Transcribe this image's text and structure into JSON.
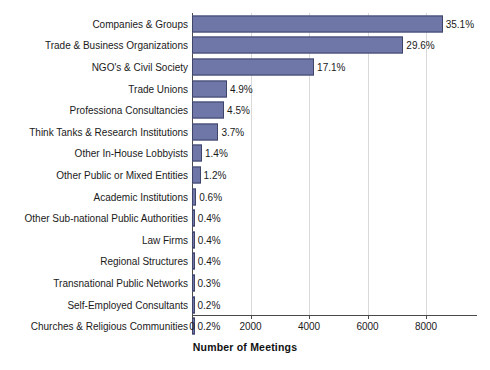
{
  "chart_data": {
    "type": "bar",
    "orientation": "horizontal",
    "title": "",
    "xlabel": "Number of Meetings",
    "ylabel": "",
    "xlim": [
      0,
      9740
    ],
    "xticks": [
      0,
      2000,
      4000,
      6000,
      8000
    ],
    "xtick_labels": [
      "0",
      "2000",
      "4000",
      "6000",
      "8000"
    ],
    "grid": "vertical",
    "legend": "none",
    "bar_color": "#6f77a9",
    "bar_edge_color": "#3f4468",
    "categories": [
      "Companies & Groups",
      "Trade & Business Organizations",
      "NGO's & Civil Society",
      "Trade Unions",
      "Professiona Consultancies",
      "Think Tanks & Research Institutions",
      "Other In-House Lobbyists",
      "Other Public or Mixed Entities",
      "Academic Institutions",
      "Other Sub-national Public Authorities",
      "Law Firms",
      "Regional Structures",
      "Transnational Public Networks",
      "Self-Employed Consultants",
      "Churches & Religious Communities"
    ],
    "values": [
      8570,
      7225,
      4174,
      1196,
      1098,
      903,
      342,
      293,
      146,
      98,
      98,
      98,
      73,
      49,
      49
    ],
    "percent_labels": [
      "35.1%",
      "29.6%",
      "17.1%",
      "4.9%",
      "4.5%",
      "3.7%",
      "1.4%",
      "1.2%",
      "0.6%",
      "0.4%",
      "0.4%",
      "0.4%",
      "0.3%",
      "0.2%",
      "0.2%"
    ],
    "percent_values": [
      35.1,
      29.6,
      17.1,
      4.9,
      4.5,
      3.7,
      1.4,
      1.2,
      0.6,
      0.4,
      0.4,
      0.4,
      0.3,
      0.2,
      0.2
    ]
  }
}
